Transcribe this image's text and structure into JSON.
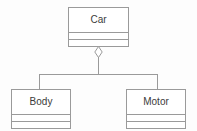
{
  "diagram": {
    "type": "uml-class-diagram",
    "notation": "UML",
    "background_color": "#fdfdfd",
    "line_color": "#9a9a9a",
    "text_color": "#3b3b3b",
    "classes": [
      {
        "id": "car",
        "name": "Car",
        "attributes": [],
        "operations": [],
        "role": "whole"
      },
      {
        "id": "body",
        "name": "Body",
        "attributes": [],
        "operations": [],
        "role": "part"
      },
      {
        "id": "motor",
        "name": "Motor",
        "attributes": [],
        "operations": [],
        "role": "part"
      }
    ],
    "relationships": [
      {
        "kind": "aggregation",
        "marker": "hollow-diamond",
        "from": "Car",
        "to": "Body",
        "label": ""
      },
      {
        "kind": "aggregation",
        "marker": "hollow-diamond",
        "from": "Car",
        "to": "Motor",
        "label": ""
      }
    ]
  }
}
